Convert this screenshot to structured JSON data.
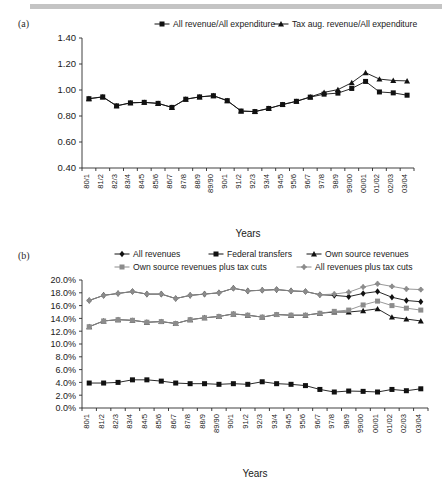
{
  "figure": {
    "panel_a_letter": "(a)",
    "panel_b_letter": "(b)"
  },
  "chart_data": [
    {
      "id": "a",
      "type": "line",
      "title": "",
      "xlabel": "Years",
      "ylabel": "",
      "ylim": [
        0.4,
        1.4
      ],
      "ytick_labels": [
        "0.40",
        "0.60",
        "0.80",
        "1.00",
        "1.20",
        "1.40"
      ],
      "ytick_values": [
        0.4,
        0.6,
        0.8,
        1.0,
        1.2,
        1.4
      ],
      "grid": false,
      "legend_position": "top",
      "categories": [
        "80/1",
        "81/2",
        "82/3",
        "83/4",
        "84/5",
        "85/6",
        "86/7",
        "87/8",
        "88/9",
        "89/90",
        "90/1",
        "91/2",
        "92/3",
        "93/4",
        "94/5",
        "95/6",
        "96/7",
        "97/8",
        "98/9",
        "99/00",
        "00/01",
        "01/02",
        "02/03",
        "03/04"
      ],
      "series": [
        {
          "name": "All revenue/All expenditure",
          "marker": "square",
          "color": "#111111",
          "values": [
            0.933,
            0.947,
            0.878,
            0.901,
            0.905,
            0.897,
            0.866,
            0.929,
            0.947,
            0.956,
            0.918,
            0.838,
            0.834,
            0.858,
            0.888,
            0.913,
            0.945,
            0.968,
            0.976,
            1.012,
            1.066,
            0.985,
            0.978,
            0.96
          ]
        },
        {
          "name": "Tax aug. revenue/All expenditure",
          "marker": "triangle",
          "color": "#111111",
          "values": [
            0.933,
            0.947,
            0.878,
            0.901,
            0.905,
            0.897,
            0.866,
            0.929,
            0.947,
            0.956,
            0.918,
            0.838,
            0.834,
            0.858,
            0.888,
            0.913,
            0.947,
            0.982,
            1.003,
            1.056,
            1.133,
            1.084,
            1.073,
            1.07
          ]
        }
      ]
    },
    {
      "id": "b",
      "type": "line",
      "title": "",
      "xlabel": "Years",
      "ylabel": "",
      "ylim": [
        0.0,
        20.0
      ],
      "ytick_labels": [
        "0.0%",
        "2.0%",
        "4.0%",
        "6.0%",
        "8.0%",
        "10.0%",
        "12.0%",
        "14.0%",
        "16.0%",
        "18.0%",
        "20.0%"
      ],
      "ytick_values": [
        0,
        2,
        4,
        6,
        8,
        10,
        12,
        14,
        16,
        18,
        20
      ],
      "grid": false,
      "legend_position": "top",
      "categories": [
        "80/1",
        "81/2",
        "82/3",
        "83/4",
        "84/5",
        "85/6",
        "86/7",
        "87/8",
        "88/9",
        "89/90",
        "90/1",
        "91/2",
        "92/3",
        "93/4",
        "94/5",
        "95/6",
        "96/7",
        "97/8",
        "98/9",
        "99/00",
        "00/01",
        "01/02",
        "02/03",
        "03/04"
      ],
      "series": [
        {
          "name": "All revenues",
          "marker": "diamond",
          "color": "#111111",
          "values": [
            16.8,
            17.6,
            17.9,
            18.2,
            17.8,
            17.8,
            17.1,
            17.6,
            17.8,
            18.0,
            18.7,
            18.3,
            18.4,
            18.5,
            18.3,
            18.2,
            17.7,
            17.6,
            17.4,
            17.9,
            18.2,
            17.3,
            16.8,
            16.6
          ]
        },
        {
          "name": "Federal transfers",
          "marker": "square",
          "color": "#111111",
          "values": [
            3.9,
            3.9,
            4.0,
            4.4,
            4.4,
            4.2,
            3.9,
            3.8,
            3.8,
            3.7,
            3.8,
            3.7,
            4.1,
            3.8,
            3.7,
            3.5,
            2.9,
            2.5,
            2.65,
            2.6,
            2.5,
            2.9,
            2.7,
            3.0
          ]
        },
        {
          "name": "Own source revenues",
          "marker": "triangle",
          "color": "#111111",
          "values": [
            12.7,
            13.6,
            13.8,
            13.7,
            13.4,
            13.5,
            13.2,
            13.8,
            14.1,
            14.3,
            14.7,
            14.5,
            14.2,
            14.6,
            14.5,
            14.5,
            14.8,
            15.0,
            15.0,
            15.2,
            15.5,
            14.2,
            13.9,
            13.6
          ]
        },
        {
          "name": "Own source revenues plus tax cuts",
          "marker": "square",
          "color": "#8c8c8c",
          "values": [
            12.7,
            13.6,
            13.8,
            13.7,
            13.4,
            13.5,
            13.2,
            13.8,
            14.1,
            14.3,
            14.7,
            14.5,
            14.2,
            14.6,
            14.5,
            14.5,
            14.8,
            15.1,
            15.3,
            16.1,
            16.7,
            16.0,
            15.6,
            15.3
          ]
        },
        {
          "name": "All revenues plus tax cuts",
          "marker": "star",
          "color": "#8c8c8c",
          "values": [
            16.8,
            17.6,
            17.9,
            18.2,
            17.8,
            17.8,
            17.1,
            17.6,
            17.8,
            18.0,
            18.7,
            18.3,
            18.4,
            18.5,
            18.3,
            18.2,
            17.7,
            17.8,
            18.1,
            18.9,
            19.4,
            19.0,
            18.6,
            18.5
          ]
        }
      ]
    }
  ]
}
